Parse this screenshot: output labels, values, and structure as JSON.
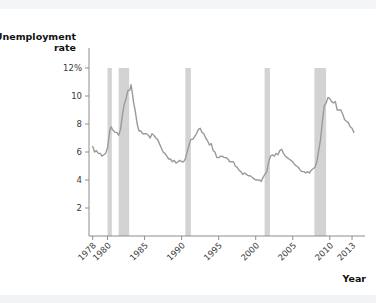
{
  "chart_data": {
    "type": "line",
    "title": "",
    "xlabel": "Year",
    "ylabel_line1": "Unemployment",
    "ylabel_line2": "rate",
    "ylim": [
      0,
      13
    ],
    "xlim": [
      1977.5,
      2013.4
    ],
    "grid": false,
    "legend": "none",
    "y_ticks": [
      {
        "value": 12,
        "label": "12%"
      },
      {
        "value": 10,
        "label": "10"
      },
      {
        "value": 8,
        "label": "8"
      },
      {
        "value": 6,
        "label": "6"
      },
      {
        "value": 4,
        "label": "4"
      },
      {
        "value": 2,
        "label": "2"
      }
    ],
    "x_ticks": [
      {
        "value": 1978,
        "label": "1978"
      },
      {
        "value": 1980,
        "label": "1980"
      },
      {
        "value": 1985,
        "label": "1985"
      },
      {
        "value": 1990,
        "label": "1990"
      },
      {
        "value": 1995,
        "label": "1995"
      },
      {
        "value": 2000,
        "label": "2000"
      },
      {
        "value": 2005,
        "label": "2005"
      },
      {
        "value": 2010,
        "label": "2010"
      },
      {
        "value": 2013,
        "label": "2013"
      }
    ],
    "shaded_regions": [
      {
        "name": "recession-1980",
        "start": 1980.0,
        "end": 1980.58
      },
      {
        "name": "recession-1981-1982",
        "start": 1981.5,
        "end": 1982.92
      },
      {
        "name": "recession-1990-1991",
        "start": 1990.5,
        "end": 1991.25
      },
      {
        "name": "recession-2001",
        "start": 2001.2,
        "end": 2001.92
      },
      {
        "name": "recession-2007-2009",
        "start": 2007.92,
        "end": 2009.5
      }
    ],
    "series": [
      {
        "name": "Unemployment rate",
        "color": "#9a9a9a",
        "x": [
          1978.0,
          1978.25,
          1978.5,
          1978.75,
          1979.0,
          1979.25,
          1979.5,
          1979.75,
          1980.0,
          1980.17,
          1980.33,
          1980.5,
          1980.67,
          1980.83,
          1981.0,
          1981.25,
          1981.5,
          1981.75,
          1982.0,
          1982.25,
          1982.5,
          1982.75,
          1983.0,
          1983.17,
          1983.33,
          1983.5,
          1983.75,
          1984.0,
          1984.25,
          1984.5,
          1984.75,
          1985.0,
          1985.25,
          1985.5,
          1985.75,
          1986.0,
          1986.25,
          1986.5,
          1986.75,
          1987.0,
          1987.25,
          1987.5,
          1987.75,
          1988.0,
          1988.25,
          1988.5,
          1988.75,
          1989.0,
          1989.25,
          1989.5,
          1989.75,
          1990.0,
          1990.25,
          1990.5,
          1990.75,
          1991.0,
          1991.25,
          1991.5,
          1991.75,
          1992.0,
          1992.25,
          1992.5,
          1992.75,
          1993.0,
          1993.25,
          1993.5,
          1993.75,
          1994.0,
          1994.25,
          1994.5,
          1994.75,
          1995.0,
          1995.25,
          1995.5,
          1995.75,
          1996.0,
          1996.25,
          1996.5,
          1996.75,
          1997.0,
          1997.25,
          1997.5,
          1997.75,
          1998.0,
          1998.25,
          1998.5,
          1998.75,
          1999.0,
          1999.25,
          1999.5,
          1999.75,
          2000.0,
          2000.25,
          2000.5,
          2000.75,
          2001.0,
          2001.25,
          2001.5,
          2001.75,
          2002.0,
          2002.25,
          2002.5,
          2002.75,
          2003.0,
          2003.25,
          2003.5,
          2003.75,
          2004.0,
          2004.25,
          2004.5,
          2004.75,
          2005.0,
          2005.25,
          2005.5,
          2005.75,
          2006.0,
          2006.25,
          2006.5,
          2006.75,
          2007.0,
          2007.25,
          2007.5,
          2007.75,
          2008.0,
          2008.25,
          2008.5,
          2008.75,
          2009.0,
          2009.25,
          2009.5,
          2009.75,
          2010.0,
          2010.25,
          2010.5,
          2010.75,
          2011.0,
          2011.25,
          2011.5,
          2011.75,
          2012.0,
          2012.25,
          2012.5,
          2012.75,
          2013.0,
          2013.25
        ],
        "y": [
          6.4,
          6.0,
          6.1,
          5.9,
          5.9,
          5.7,
          5.8,
          5.9,
          6.3,
          7.0,
          7.6,
          7.8,
          7.6,
          7.5,
          7.4,
          7.4,
          7.2,
          7.6,
          8.6,
          9.4,
          9.8,
          10.4,
          10.4,
          10.8,
          10.3,
          9.6,
          8.9,
          8.0,
          7.5,
          7.5,
          7.3,
          7.3,
          7.3,
          7.2,
          7.0,
          7.3,
          7.2,
          7.0,
          6.9,
          6.6,
          6.3,
          6.0,
          5.9,
          5.7,
          5.5,
          5.5,
          5.3,
          5.4,
          5.2,
          5.3,
          5.4,
          5.3,
          5.3,
          5.5,
          6.0,
          6.5,
          6.9,
          6.9,
          7.1,
          7.3,
          7.6,
          7.7,
          7.4,
          7.3,
          7.0,
          6.8,
          6.5,
          6.6,
          6.1,
          6.0,
          5.6,
          5.6,
          5.7,
          5.7,
          5.6,
          5.6,
          5.5,
          5.3,
          5.3,
          5.3,
          5.0,
          4.9,
          4.7,
          4.6,
          4.4,
          4.5,
          4.4,
          4.3,
          4.3,
          4.2,
          4.1,
          4.0,
          4.0,
          4.0,
          3.9,
          4.2,
          4.4,
          4.6,
          5.3,
          5.7,
          5.8,
          5.7,
          5.9,
          5.8,
          6.1,
          6.2,
          5.9,
          5.7,
          5.6,
          5.5,
          5.4,
          5.3,
          5.1,
          5.0,
          4.9,
          4.7,
          4.6,
          4.6,
          4.5,
          4.6,
          4.5,
          4.7,
          4.8,
          4.9,
          5.3,
          6.1,
          6.9,
          8.2,
          9.3,
          9.5,
          9.9,
          9.8,
          9.6,
          9.5,
          9.6,
          9.0,
          9.0,
          9.0,
          8.7,
          8.3,
          8.2,
          8.1,
          7.8,
          7.7,
          7.4
        ]
      }
    ]
  }
}
